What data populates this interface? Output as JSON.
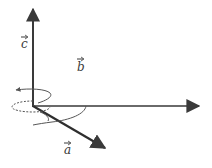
{
  "diagram": {
    "type": "vector-axes-with-rotation",
    "background": "#ffffff",
    "stroke_color": "#3a3a3a",
    "dashed_color": "#555555",
    "vectors": [
      {
        "id": "c",
        "label": "c",
        "direction": "up"
      },
      {
        "id": "b",
        "label": "b",
        "direction": "right"
      },
      {
        "id": "a",
        "label": "a",
        "direction": "down-right"
      }
    ],
    "rotation_markers": [
      {
        "name": "rotation-about-c",
        "style": "dashed-ellipse-with-arrow"
      },
      {
        "name": "rotation-about-a",
        "style": "arc-around-a"
      }
    ]
  }
}
